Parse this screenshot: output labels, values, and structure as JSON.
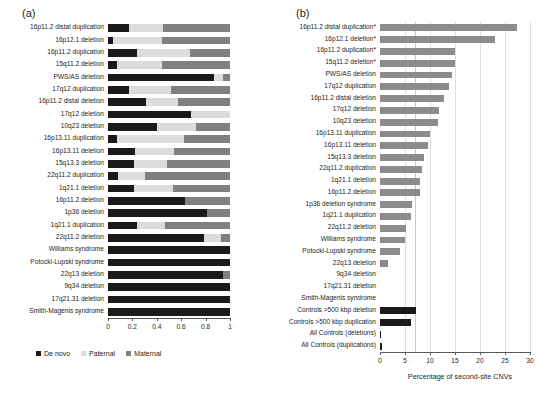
{
  "figure": {
    "panel_a_letter": "(a)",
    "panel_b_letter": "(b)"
  },
  "panel_a": {
    "legend": [
      {
        "label": "De novo",
        "color": "#1a1a1a",
        "key": "de_novo"
      },
      {
        "label": "Paternal",
        "color": "#dcdcdc",
        "key": "paternal"
      },
      {
        "label": "Maternal",
        "color": "#808080",
        "key": "maternal"
      }
    ],
    "axis": {
      "min": 0,
      "max": 1,
      "ticks": [
        0,
        0.2,
        0.4,
        0.6,
        0.8,
        1
      ],
      "tick_labels": [
        "0",
        "0.2",
        "0.4",
        "0.6",
        "0.8",
        "1"
      ]
    }
  },
  "panel_b": {
    "axis": {
      "min": 0,
      "max": 30,
      "ticks": [
        0,
        5,
        10,
        15,
        20,
        25,
        30
      ],
      "tick_labels": [
        "0",
        "5",
        "10",
        "15",
        "20",
        "25",
        "30"
      ],
      "title": "Percentage of second-site CNVs",
      "reference_line": 7
    },
    "bar_color": "#8c8c8c",
    "control_bar_color": "#1a1a1a",
    "significance_marker": "*"
  },
  "chart_data": [
    {
      "type": "bar",
      "orientation": "horizontal",
      "stacked": true,
      "title": "(a)",
      "xlabel": "",
      "ylabel": "",
      "xlim": [
        0,
        1
      ],
      "grid": false,
      "legend_position": "bottom",
      "categories": [
        "16p11.2 distal duplication",
        "16p12.1 deletion",
        "16p11.2 duplication",
        "15q11.2 deletion",
        "PWS/AS deletion",
        "17q12 duplication",
        "16p11.2 distal deletion",
        "17q12 deletion",
        "10q23 deletion",
        "16p13.11 duplication",
        "16p13.11 deletion",
        "15q13.3 deletion",
        "22q11.2 duplication",
        "1q21.1 deletion",
        "16p11.2 deletion",
        "1p36 deletion",
        "1q21.1 duplication",
        "22q11.2 deletion",
        "Williams syndrome",
        "Potocki-Lupski syndrome",
        "22q13 deletion",
        "9q34 deletion",
        "17q21.31 deletion",
        "Smith-Magenis syndrome"
      ],
      "series": [
        {
          "name": "De novo",
          "color": "#1a1a1a",
          "values": [
            0.17,
            0.04,
            0.24,
            0.07,
            0.87,
            0.17,
            0.31,
            0.68,
            0.4,
            0.07,
            0.22,
            0.21,
            0.08,
            0.21,
            0.63,
            0.81,
            0.24,
            0.79,
            1.0,
            1.0,
            0.94,
            1.0,
            1.0,
            1.0
          ]
        },
        {
          "name": "Paternal",
          "color": "#dcdcdc",
          "values": [
            0.28,
            0.4,
            0.43,
            0.37,
            0.07,
            0.35,
            0.26,
            0.32,
            0.32,
            0.55,
            0.32,
            0.27,
            0.22,
            0.32,
            0.0,
            0.0,
            0.23,
            0.14,
            0.0,
            0.0,
            0.0,
            0.0,
            0.0,
            0.0
          ]
        },
        {
          "name": "Maternal",
          "color": "#808080",
          "values": [
            0.55,
            0.56,
            0.33,
            0.56,
            0.06,
            0.48,
            0.43,
            0.0,
            0.28,
            0.38,
            0.46,
            0.52,
            0.7,
            0.47,
            0.37,
            0.19,
            0.53,
            0.07,
            0.0,
            0.0,
            0.06,
            0.0,
            0.0,
            0.0
          ]
        }
      ]
    },
    {
      "type": "bar",
      "orientation": "horizontal",
      "stacked": false,
      "title": "(b)",
      "xlabel": "Percentage of second-site CNVs",
      "ylabel": "",
      "xlim": [
        0,
        30
      ],
      "grid": false,
      "reference_line": 7,
      "categories": [
        "16p11.2 distal duplication*",
        "16p12.1 deletion*",
        "16p11.2 duplication*",
        "15q11.2 deletion*",
        "PWS/AS deletion",
        "17q12 duplication",
        "16p11.2 distal deletion",
        "17q12 deletion",
        "10q23 deletion",
        "16p13.11 duplication",
        "16p13.11 deletion",
        "15q13.3 deletion",
        "22q11.2 duplication",
        "1q21.1 deletion",
        "16p11.2 deletion",
        "1p36 deletion syndrome",
        "1q21.1 duplication",
        "22q11.2 deletion",
        "Williams syndrome",
        "Potocki-Lupski syndrome",
        "22q13 deletion",
        "9q34 deletion",
        "17q21.31 deletion",
        "Smith-Magenis syndrome",
        "Controls >500 kbp deletion",
        "Controls >500 kbp duplication",
        "All Controls (deletions)",
        "All Controls (duplications)"
      ],
      "values": [
        27.3,
        23.0,
        15.0,
        15.0,
        14.3,
        13.8,
        12.8,
        11.8,
        11.5,
        10.0,
        9.5,
        8.8,
        8.3,
        8.0,
        8.0,
        6.4,
        6.2,
        5.2,
        4.9,
        4.0,
        1.6,
        0.0,
        0.0,
        0.0,
        7.2,
        6.2,
        0.1,
        0.4
      ],
      "is_control": [
        false,
        false,
        false,
        false,
        false,
        false,
        false,
        false,
        false,
        false,
        false,
        false,
        false,
        false,
        false,
        false,
        false,
        false,
        false,
        false,
        false,
        false,
        false,
        false,
        true,
        true,
        true,
        true
      ]
    }
  ]
}
